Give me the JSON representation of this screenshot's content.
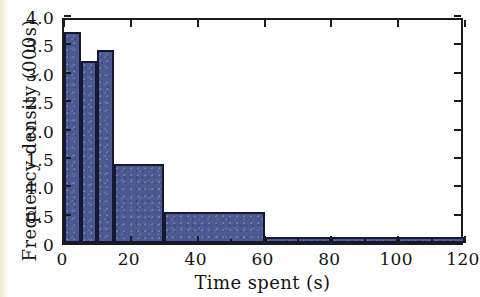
{
  "chart_data": {
    "type": "bar",
    "title": "",
    "subtitle": "",
    "xlabel": "Time spent (s)",
    "ylabel": "Frequency density (000s)",
    "xlim": [
      0,
      120
    ],
    "ylim": [
      0,
      4.0
    ],
    "grid": false,
    "legend": null,
    "x_ticks": [
      {
        "value": 0,
        "label": "0"
      },
      {
        "value": 20,
        "label": "20"
      },
      {
        "value": 40,
        "label": "40"
      },
      {
        "value": 60,
        "label": "60"
      },
      {
        "value": 80,
        "label": "80"
      },
      {
        "value": 100,
        "label": "100"
      },
      {
        "value": 120,
        "label": "120"
      }
    ],
    "x_minor_ticks": [
      10,
      30,
      50,
      70,
      90,
      110
    ],
    "y_ticks": [
      {
        "value": 0,
        "label": "0"
      },
      {
        "value": 0.5,
        "label": "0.5"
      },
      {
        "value": 1.0,
        "label": "1.0"
      },
      {
        "value": 1.5,
        "label": "1.5"
      },
      {
        "value": 2.0,
        "label": "2.0"
      },
      {
        "value": 2.5,
        "label": "2.5"
      },
      {
        "value": 3.0,
        "label": "3.0"
      },
      {
        "value": 3.5,
        "label": "3.5"
      },
      {
        "value": 4.0,
        "label": "4.0"
      }
    ],
    "bar_fill_color": "#4b5a93",
    "bar_edge_color": "#15182e",
    "bins": [
      {
        "x0": 0,
        "x1": 5,
        "height": 3.72
      },
      {
        "x0": 5,
        "x1": 10,
        "height": 3.2
      },
      {
        "x0": 10,
        "x1": 15,
        "height": 3.4
      },
      {
        "x0": 15,
        "x1": 30,
        "height": 1.4
      },
      {
        "x0": 30,
        "x1": 60,
        "height": 0.55
      },
      {
        "x0": 60,
        "x1": 80,
        "height": 0.1
      },
      {
        "x0": 80,
        "x1": 100,
        "height": 0.1
      },
      {
        "x0": 100,
        "x1": 120,
        "height": 0.1
      }
    ],
    "categories": [
      "0-5",
      "5-10",
      "10-15",
      "15-30",
      "30-60",
      "60-80",
      "80-100",
      "100-120"
    ],
    "values": [
      3.72,
      3.2,
      3.4,
      1.4,
      0.55,
      0.1,
      0.1,
      0.1
    ]
  }
}
